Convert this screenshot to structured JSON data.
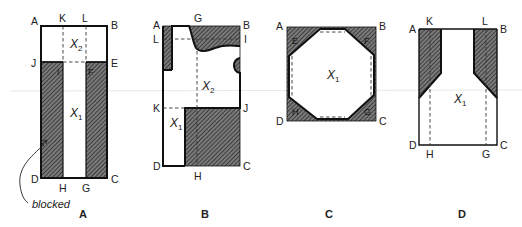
{
  "figure": {
    "annotation": "blocked",
    "hatch_color": "#4a4a4a",
    "line_color": "#111111",
    "panels": [
      {
        "id": "A",
        "label": "A",
        "corner_labels": {
          "A": "A",
          "K": "K",
          "L": "L",
          "B": "B",
          "J": "J",
          "I": "I",
          "F": "F",
          "E": "E",
          "D": "D",
          "H": "H",
          "G": "G",
          "C": "C"
        },
        "regions": [
          {
            "name": "X",
            "sub": "2"
          },
          {
            "name": "X",
            "sub": "1"
          }
        ]
      },
      {
        "id": "B",
        "label": "B",
        "corner_labels": {
          "A": "A",
          "G": "G",
          "B": "B",
          "L": "L",
          "I": "I",
          "K": "K",
          "J": "J",
          "D": "D",
          "H": "H",
          "C": "C"
        },
        "regions": [
          {
            "name": "X",
            "sub": "2"
          },
          {
            "name": "X",
            "sub": "1"
          }
        ]
      },
      {
        "id": "C",
        "label": "C",
        "corner_labels": {
          "A": "A",
          "B": "B",
          "E": "E",
          "F": "F",
          "H": "H",
          "G": "G",
          "D": "D",
          "C": "C"
        },
        "regions": [
          {
            "name": "X",
            "sub": "1"
          }
        ]
      },
      {
        "id": "D",
        "label": "D",
        "corner_labels": {
          "A": "A",
          "K": "K",
          "L": "L",
          "B": "B",
          "D": "D",
          "H": "H",
          "G": "G",
          "C": "C"
        },
        "regions": [
          {
            "name": "X",
            "sub": "1"
          }
        ]
      }
    ]
  }
}
